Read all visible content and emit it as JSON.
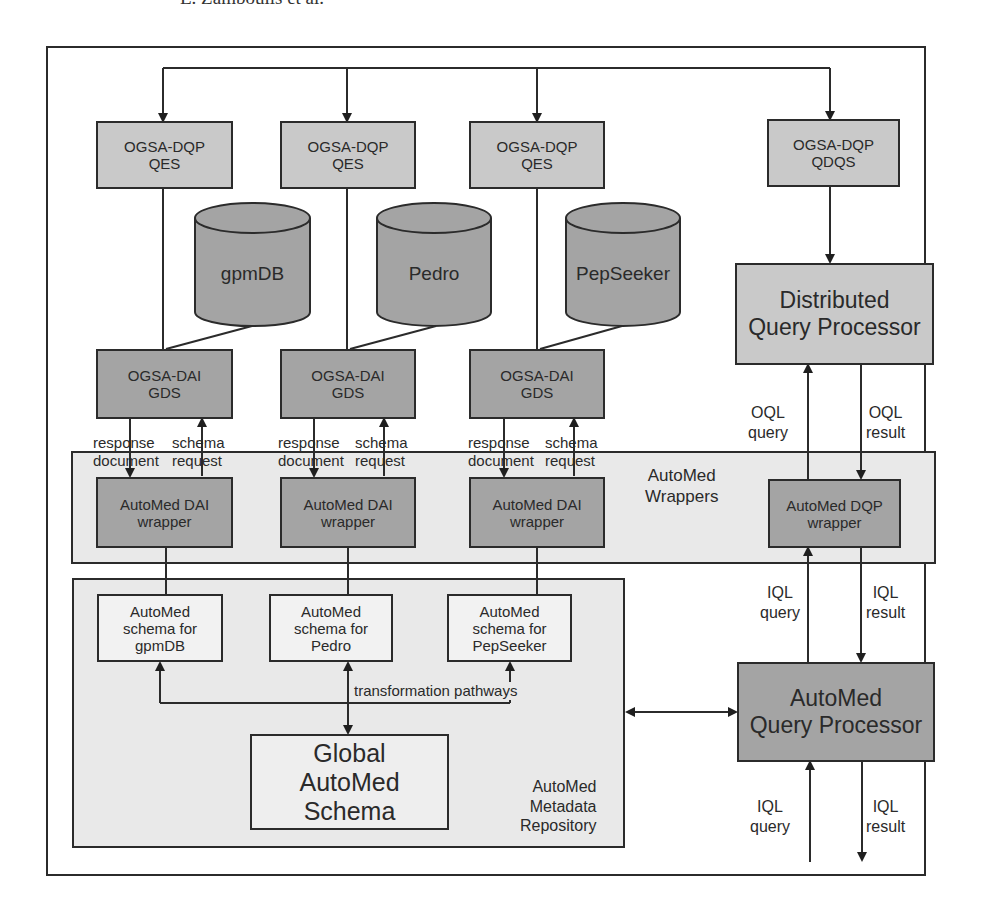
{
  "header": {
    "text": "E. Zamboulis et al."
  },
  "colors": {
    "light_box": "#c9c9c9",
    "dark_box": "#a4a4a4",
    "region_fill": "#e9e9e9",
    "schema_box": "#f2f2f2",
    "line": "#2b2b2b"
  },
  "qes_boxes": [
    {
      "line1": "OGSA-DQP",
      "line2": "QES"
    },
    {
      "line1": "OGSA-DQP",
      "line2": "QES"
    },
    {
      "line1": "OGSA-DQP",
      "line2": "QES"
    }
  ],
  "qdqs_box": {
    "line1": "OGSA-DQP",
    "line2": "QDQS"
  },
  "databases": [
    {
      "label": "gpmDB"
    },
    {
      "label": "Pedro"
    },
    {
      "label": "PepSeeker"
    }
  ],
  "gds_boxes": [
    {
      "line1": "OGSA-DAI",
      "line2": "GDS"
    },
    {
      "line1": "OGSA-DAI",
      "line2": "GDS"
    },
    {
      "line1": "OGSA-DAI",
      "line2": "GDS"
    }
  ],
  "dqp": {
    "line1": "Distributed",
    "line2": "Query Processor"
  },
  "gds_edges": {
    "down_label": {
      "line1": "response",
      "line2": "document"
    },
    "up_label": {
      "line1": "schema",
      "line2": "request"
    }
  },
  "oql": {
    "query": {
      "line1": "OQL",
      "line2": "query"
    },
    "result": {
      "line1": "OQL",
      "line2": "result"
    }
  },
  "wrappers_region": {
    "line1": "AutoMed",
    "line2": "Wrappers"
  },
  "dai_wrappers": [
    {
      "line1": "AutoMed DAI",
      "line2": "wrapper"
    },
    {
      "line1": "AutoMed DAI",
      "line2": "wrapper"
    },
    {
      "line1": "AutoMed DAI",
      "line2": "wrapper"
    }
  ],
  "dqp_wrapper": {
    "line1": "AutoMed DQP",
    "line2": "wrapper"
  },
  "iql_upper": {
    "query": {
      "line1": "IQL",
      "line2": "query"
    },
    "result": {
      "line1": "IQL",
      "line2": "result"
    }
  },
  "schemas": [
    {
      "line1": "AutoMed",
      "line2": "schema for",
      "line3": "gpmDB"
    },
    {
      "line1": "AutoMed",
      "line2": "schema for",
      "line3": "Pedro"
    },
    {
      "line1": "AutoMed",
      "line2": "schema for",
      "line3": "PepSeeker"
    }
  ],
  "transformation_label": "transformation pathways",
  "global_schema": {
    "line1": "Global",
    "line2": "AutoMed Schema"
  },
  "repository": {
    "line1": "AutoMed",
    "line2": "Metadata",
    "line3": "Repository"
  },
  "query_processor": {
    "line1": "AutoMed",
    "line2": "Query Processor"
  },
  "iql_lower": {
    "query": {
      "line1": "IQL",
      "line2": "query"
    },
    "result": {
      "line1": "IQL",
      "line2": "result"
    }
  }
}
